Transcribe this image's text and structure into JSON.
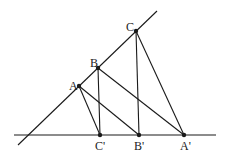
{
  "diagram": {
    "colors": {
      "stroke": "#1a1a1a",
      "background": "#ffffff"
    },
    "lines": {
      "horizontal": {
        "x1": 14,
        "y1": 135,
        "x2": 216,
        "y2": 135
      },
      "diagonal": {
        "x1": 18,
        "y1": 145,
        "x2": 157,
        "y2": 11
      }
    },
    "points": {
      "A": {
        "label": "A",
        "x": 79,
        "y": 86,
        "lx": 69,
        "ly": 90
      },
      "B": {
        "label": "B",
        "x": 98,
        "y": 68,
        "lx": 90,
        "ly": 67
      },
      "C": {
        "label": "C",
        "x": 136,
        "y": 31,
        "lx": 126,
        "ly": 31
      },
      "Cp": {
        "label": "C'",
        "x": 100,
        "y": 135,
        "lx": 95,
        "ly": 150
      },
      "Bp": {
        "label": "B'",
        "x": 139,
        "y": 135,
        "lx": 134,
        "ly": 150
      },
      "Ap": {
        "label": "A'",
        "x": 184,
        "y": 135,
        "lx": 180,
        "ly": 150
      }
    },
    "segments": [
      {
        "from": "A",
        "to": "Cp"
      },
      {
        "from": "A",
        "to": "Bp"
      },
      {
        "from": "B",
        "to": "Cp"
      },
      {
        "from": "B",
        "to": "Ap"
      },
      {
        "from": "C",
        "to": "Bp"
      },
      {
        "from": "C",
        "to": "Ap"
      }
    ]
  }
}
